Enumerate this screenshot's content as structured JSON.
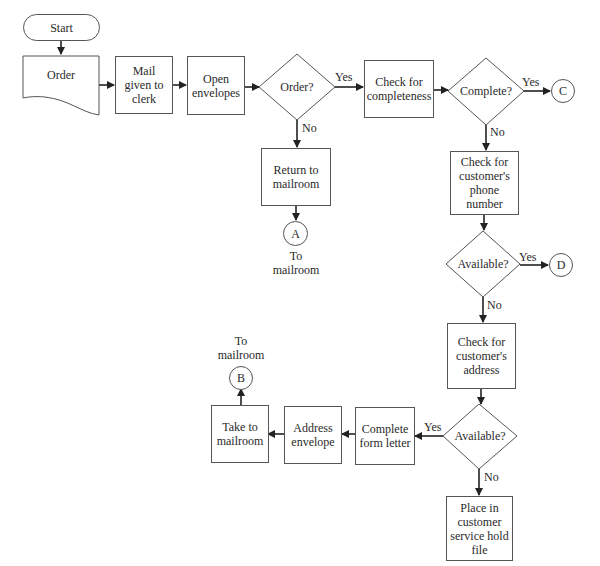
{
  "flowchart": {
    "start": "Start",
    "order_doc": "Order",
    "mail_given": "Mail given to clerk",
    "open_envelopes": "Open envelopes",
    "order_decision": "Order?",
    "check_completeness": "Check for completeness",
    "complete_decision": "Complete?",
    "return_mailroom": "Return to mailroom",
    "check_phone": "Check for customer's phone number",
    "phone_available": "Available?",
    "check_address": "Check for customer's address",
    "address_available": "Available?",
    "complete_form_letter": "Complete form letter",
    "address_envelope": "Address envelope",
    "take_mailroom": "Take to mailroom",
    "hold_file": "Place in customer service hold file",
    "connectors": {
      "a": "A",
      "b": "B",
      "c": "C",
      "d": "D"
    },
    "connector_notes": {
      "a": "To mailroom",
      "b": "To mailroom"
    },
    "edge_labels": {
      "order_yes": "Yes",
      "order_no": "No",
      "complete_yes": "Yes",
      "complete_no": "No",
      "phone_yes": "Yes",
      "phone_no": "No",
      "address_yes": "Yes",
      "address_no": "No"
    }
  }
}
